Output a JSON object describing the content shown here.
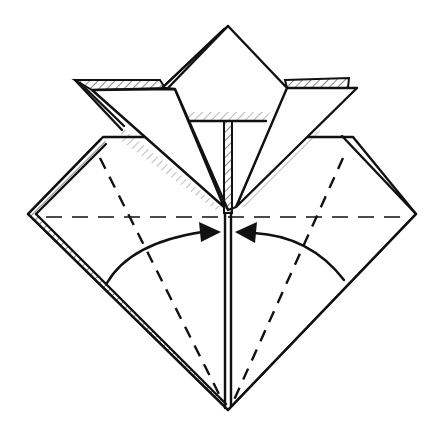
{
  "diagram": {
    "type": "origami-fold-step",
    "colors": {
      "ink": "#111111",
      "paper": "#ffffff"
    },
    "elements": [
      "outer-square-base",
      "top-point-flap",
      "left-wing-flap",
      "right-wing-flap",
      "center-slit",
      "horizontal-valley-fold-line",
      "left-diagonal-valley-fold-line",
      "right-diagonal-valley-fold-line",
      "left-fold-arrow",
      "right-fold-arrow"
    ],
    "instruction_symbols": {
      "fold_lines": "dashed (valley fold)",
      "arrows": "curved arrows pointing toward center line"
    }
  }
}
